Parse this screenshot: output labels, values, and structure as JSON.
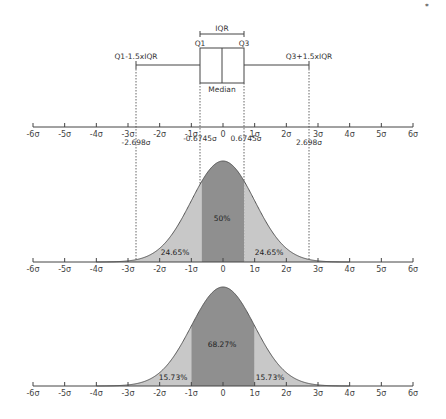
{
  "corner_mark": "*",
  "boxplot": {
    "iqr_label": "IQR",
    "q1_label": "Q1",
    "q3_label": "Q3",
    "median_label": "Median",
    "lower_whisker_label": "Q1-1.5xIQR",
    "upper_whisker_label": "Q3+1.5xIQR"
  },
  "axis_ticks": [
    "-6σ",
    "-5σ",
    "-4σ",
    "-3σ",
    "-2σ",
    "-1σ",
    "0",
    "1σ",
    "2σ",
    "3σ",
    "4σ",
    "5σ",
    "6σ"
  ],
  "annotations": {
    "lower_fence": "-2.698σ",
    "q1_pos": "-0.6745σ",
    "q3_pos": "0.6745σ",
    "upper_fence": "2.698σ"
  },
  "panel_quartiles": {
    "left": "24.65%",
    "center": "50%",
    "right": "24.65%"
  },
  "panel_sigma": {
    "left": "15.73%",
    "center": "68.27%",
    "right": "15.73%"
  },
  "colors": {
    "light_fill": "#c8c8c8",
    "dark_fill": "#8f8f8f",
    "curve_stroke": "#555555",
    "axis": "#444444"
  },
  "chart_data": {
    "type": "area",
    "x_axis": {
      "ticks": [
        "-6σ",
        "-5σ",
        "-4σ",
        "-3σ",
        "-2σ",
        "-1σ",
        "0",
        "1σ",
        "2σ",
        "3σ",
        "4σ",
        "5σ",
        "6σ"
      ],
      "range": [
        -6,
        6
      ]
    },
    "boxplot": {
      "q1": -0.6745,
      "median": 0,
      "q3": 0.6745,
      "lower_fence": -2.698,
      "upper_fence": 2.698
    },
    "panels": [
      {
        "name": "quartile regions",
        "regions": [
          {
            "from": -2.698,
            "to": -0.6745,
            "value": 24.65,
            "label": "24.65%"
          },
          {
            "from": -0.6745,
            "to": 0.6745,
            "value": 50,
            "label": "50%"
          },
          {
            "from": 0.6745,
            "to": 2.698,
            "value": 24.65,
            "label": "24.65%"
          }
        ]
      },
      {
        "name": "sigma regions",
        "regions": [
          {
            "from": -3,
            "to": -1,
            "value": 15.73,
            "label": "15.73%"
          },
          {
            "from": -1,
            "to": 1,
            "value": 68.27,
            "label": "68.27%"
          },
          {
            "from": 1,
            "to": 3,
            "value": 15.73,
            "label": "15.73%"
          }
        ]
      }
    ]
  }
}
